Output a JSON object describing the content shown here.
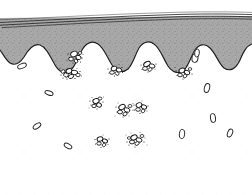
{
  "figure": {
    "title": "Mucosal surface cross-section with bacterial colonization",
    "type": "biological-illustration",
    "width": 252,
    "height": 195,
    "background_color": "#ffffff",
    "ink_color": "#1a1a1a"
  },
  "layers": {
    "surface_membrane": {
      "label": "surface membrane lines",
      "line_count": 4,
      "color": "#2b2b2b",
      "stroke_width": 0.9,
      "description": "thin nearly-horizontal parallel lines across the top, slightly tilted"
    },
    "mucus_layer": {
      "label": "mucus / gray tissue layer",
      "fill_color": "#a8a8a8",
      "stipple_color": "#8a8a8a",
      "outline_color": "#1f1f1f",
      "top_y": 18,
      "description": "solid gray stippled band whose lower edge is wavy and scalloped"
    },
    "epithelium": {
      "label": "epithelial layer (white)",
      "fill_color": "#ffffff",
      "outline_color": "#1f1f1f",
      "description": "white region below the gray layer with rounded villus-like projections rising into it"
    }
  },
  "boundary": {
    "label": "wavy mucosa boundary",
    "peak_count": 6,
    "min_y": 40,
    "max_y": 72
  },
  "bacteria": {
    "legend_label": "bacterial cells",
    "clusters": [
      {
        "name": "cluster-a",
        "x": 75,
        "y": 57,
        "cocci": 5,
        "rods": 1,
        "dots": 7
      },
      {
        "name": "cluster-b",
        "x": 72,
        "y": 73,
        "cocci": 6,
        "rods": 2,
        "dots": 9
      },
      {
        "name": "cluster-c",
        "x": 116,
        "y": 70,
        "cocci": 4,
        "rods": 1,
        "dots": 6
      },
      {
        "name": "cluster-d",
        "x": 149,
        "y": 66,
        "cocci": 4,
        "rods": 2,
        "dots": 5
      },
      {
        "name": "cluster-e",
        "x": 184,
        "y": 73,
        "cocci": 5,
        "rods": 1,
        "dots": 6
      },
      {
        "name": "cluster-f",
        "x": 97,
        "y": 103,
        "cocci": 4,
        "rods": 1,
        "dots": 7
      },
      {
        "name": "cluster-g",
        "x": 124,
        "y": 110,
        "cocci": 5,
        "rods": 2,
        "dots": 8
      },
      {
        "name": "cluster-h",
        "x": 141,
        "y": 107,
        "cocci": 5,
        "rods": 1,
        "dots": 6
      },
      {
        "name": "cluster-i",
        "x": 136,
        "y": 140,
        "cocci": 6,
        "rods": 1,
        "dots": 9
      },
      {
        "name": "cluster-j",
        "x": 102,
        "y": 141,
        "cocci": 4,
        "rods": 1,
        "dots": 6
      }
    ],
    "solitary_rods": [
      {
        "name": "rod-1",
        "x": 22,
        "y": 66,
        "angle": -22
      },
      {
        "name": "rod-2",
        "x": 49,
        "y": 93,
        "angle": 18
      },
      {
        "name": "rod-3",
        "x": 37,
        "y": 126,
        "angle": -35
      },
      {
        "name": "rod-4",
        "x": 195,
        "y": 58,
        "angle": 8
      },
      {
        "name": "rod-5",
        "x": 207,
        "y": 88,
        "angle": 14
      },
      {
        "name": "rod-6",
        "x": 213,
        "y": 118,
        "angle": -8
      },
      {
        "name": "rod-7",
        "x": 230,
        "y": 133,
        "angle": 22
      },
      {
        "name": "rod-8",
        "x": 182,
        "y": 134,
        "angle": 5
      },
      {
        "name": "rod-9",
        "x": 68,
        "y": 146,
        "angle": 30
      }
    ],
    "cocci_color": "#111111",
    "rod_color": "#222222"
  }
}
